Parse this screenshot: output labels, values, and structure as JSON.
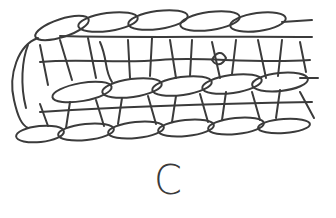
{
  "figure": {
    "label": "C",
    "line_color": "#3b3b3b",
    "background": "#ffffff"
  }
}
